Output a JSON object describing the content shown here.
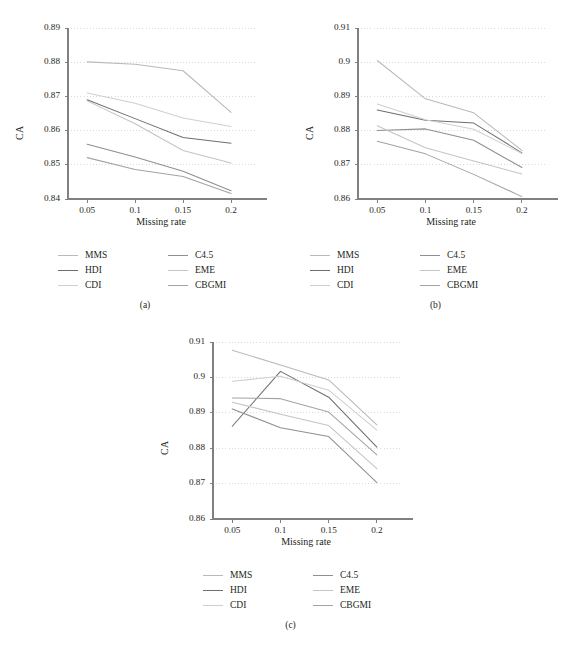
{
  "figure": {
    "axis_title_y": "CA",
    "axis_title_x": "Missing rate",
    "series_names": [
      "MMS",
      "HDI",
      "CDI",
      "C4.5",
      "EME",
      "CBGMI"
    ],
    "series_colors": [
      "#b9b9b9",
      "#6e6e6e",
      "#cfcfcf",
      "#8f8f8f",
      "#c4c4c4",
      "#a3a3a3"
    ],
    "legend_columns": [
      [
        "MMS",
        "HDI",
        "CDI"
      ],
      [
        "C4.5",
        "EME",
        "CBGMI"
      ]
    ]
  },
  "panels": [
    {
      "caption": "(a)",
      "ylabel": "CA",
      "xlabel": "Missing rate",
      "xticks": [
        "0.05",
        "0.1",
        "0.15",
        "0.2"
      ],
      "yticks": [
        "0.84",
        "0.85",
        "0.86",
        "0.87",
        "0.88",
        "0.89"
      ]
    },
    {
      "caption": "(b)",
      "ylabel": "CA",
      "xlabel": "Missing rate",
      "xticks": [
        "0.05",
        "0.1",
        "0.15",
        "0.2"
      ],
      "yticks": [
        "0.86",
        "0.87",
        "0.88",
        "0.89",
        "0.9",
        "0.91"
      ]
    },
    {
      "caption": "(c)",
      "ylabel": "CA",
      "xlabel": "Missing rate",
      "xticks": [
        "0.05",
        "0.1",
        "0.15",
        "0.2"
      ],
      "yticks": [
        "0.86",
        "0.87",
        "0.88",
        "0.89",
        "0.9",
        "0.91"
      ]
    }
  ],
  "chart_data": [
    {
      "type": "line",
      "title": "(a)",
      "xlabel": "Missing rate",
      "ylabel": "CA",
      "x": [
        0.05,
        0.1,
        0.15,
        0.2
      ],
      "xlim": [
        0.03,
        0.225
      ],
      "ylim": [
        0.84,
        0.89
      ],
      "yticks": [
        0.84,
        0.85,
        0.86,
        0.87,
        0.88,
        0.89
      ],
      "grid": true,
      "legend_position": "below",
      "series": [
        {
          "name": "MMS",
          "color": "#b9b9b9",
          "values": [
            0.8801,
            0.8794,
            0.8775,
            0.8653
          ]
        },
        {
          "name": "HDI",
          "color": "#6e6e6e",
          "values": [
            0.869,
            0.8635,
            0.858,
            0.8563
          ]
        },
        {
          "name": "CDI",
          "color": "#cfcfcf",
          "values": [
            0.871,
            0.868,
            0.8637,
            0.8612
          ]
        },
        {
          "name": "C4.5",
          "color": "#8f8f8f",
          "values": [
            0.856,
            0.8523,
            0.8481,
            0.8424
          ]
        },
        {
          "name": "EME",
          "color": "#c4c4c4",
          "values": [
            0.8687,
            0.862,
            0.8542,
            0.8505
          ]
        },
        {
          "name": "CBGMI",
          "color": "#a3a3a3",
          "values": [
            0.8521,
            0.8486,
            0.8466,
            0.8416
          ]
        }
      ]
    },
    {
      "type": "line",
      "title": "(b)",
      "xlabel": "Missing rate",
      "ylabel": "CA",
      "x": [
        0.05,
        0.1,
        0.15,
        0.2
      ],
      "xlim": [
        0.03,
        0.225
      ],
      "ylim": [
        0.86,
        0.91
      ],
      "yticks": [
        0.86,
        0.87,
        0.88,
        0.89,
        0.9,
        0.91
      ],
      "grid": true,
      "legend_position": "below",
      "series": [
        {
          "name": "MMS",
          "color": "#b9b9b9",
          "values": [
            0.9005,
            0.8893,
            0.8852,
            0.8742
          ]
        },
        {
          "name": "HDI",
          "color": "#6e6e6e",
          "values": [
            0.886,
            0.883,
            0.8822,
            0.8735
          ]
        },
        {
          "name": "CDI",
          "color": "#cfcfcf",
          "values": [
            0.8878,
            0.8832,
            0.8804,
            0.8733
          ]
        },
        {
          "name": "C4.5",
          "color": "#8f8f8f",
          "values": [
            0.88,
            0.8805,
            0.8772,
            0.8692
          ]
        },
        {
          "name": "EME",
          "color": "#c4c4c4",
          "values": [
            0.8814,
            0.875,
            0.8711,
            0.8673
          ]
        },
        {
          "name": "CBGMI",
          "color": "#a3a3a3",
          "values": [
            0.8769,
            0.8732,
            0.8672,
            0.8607
          ]
        }
      ]
    },
    {
      "type": "line",
      "title": "(c)",
      "xlabel": "Missing rate",
      "ylabel": "CA",
      "x": [
        0.05,
        0.1,
        0.15,
        0.2
      ],
      "xlim": [
        0.03,
        0.225
      ],
      "ylim": [
        0.86,
        0.91
      ],
      "yticks": [
        0.86,
        0.87,
        0.88,
        0.89,
        0.9,
        0.91
      ],
      "grid": true,
      "legend_position": "below",
      "series": [
        {
          "name": "MMS",
          "color": "#b9b9b9",
          "values": [
            0.9077,
            0.9035,
            0.8993,
            0.8866
          ]
        },
        {
          "name": "HDI",
          "color": "#6e6e6e",
          "values": [
            0.8862,
            0.9017,
            0.8944,
            0.8803
          ]
        },
        {
          "name": "CDI",
          "color": "#cfcfcf",
          "values": [
            0.8989,
            0.9003,
            0.8964,
            0.8851
          ]
        },
        {
          "name": "C4.5",
          "color": "#8f8f8f",
          "values": [
            0.8911,
            0.8858,
            0.8833,
            0.8703
          ]
        },
        {
          "name": "EME",
          "color": "#c4c4c4",
          "values": [
            0.893,
            0.8896,
            0.8864,
            0.8742
          ]
        },
        {
          "name": "CBGMI",
          "color": "#a3a3a3",
          "values": [
            0.8942,
            0.894,
            0.8902,
            0.8781
          ]
        }
      ]
    }
  ]
}
